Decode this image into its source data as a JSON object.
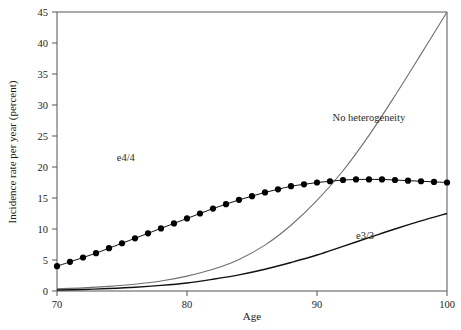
{
  "chart_data": {
    "type": "line",
    "title": "",
    "xlabel": "Age",
    "ylabel": "Incidence rate per year (percent)",
    "xlim": [
      70,
      100
    ],
    "ylim": [
      0,
      45
    ],
    "xticks": [
      70,
      80,
      90,
      100
    ],
    "xtick_labels": [
      "70",
      "80",
      "90",
      "100"
    ],
    "yticks": [
      0,
      5,
      10,
      15,
      20,
      25,
      30,
      35,
      40,
      45
    ],
    "ytick_labels": [
      "0",
      "5",
      "10",
      "15",
      "20",
      "25",
      "30",
      "35",
      "40",
      "45"
    ],
    "grid": false,
    "legend_position": "inline-annotations",
    "annotations": [
      {
        "text": "No heterogeneity",
        "x": 91.2,
        "y": 27.5
      },
      {
        "text": "e4/4",
        "x": 74.6,
        "y": 21.0
      },
      {
        "text": "e3/3",
        "x": 93.0,
        "y": 8.4
      }
    ],
    "series": [
      {
        "name": "No heterogeneity",
        "style": "thin-gray-line",
        "color": "#6f6f6f",
        "markers": false,
        "x": [
          70,
          72,
          74,
          76,
          78,
          80,
          82,
          84,
          86,
          88,
          90,
          92,
          94,
          96,
          98,
          100
        ],
        "values": [
          0.35,
          0.5,
          0.75,
          1.1,
          1.6,
          2.4,
          3.5,
          5.1,
          7.4,
          10.6,
          14.6,
          19.4,
          25.1,
          31.5,
          38.2,
          45.0
        ]
      },
      {
        "name": "e4/4",
        "style": "black-line-with-filled-circles",
        "color": "#000000",
        "markers": true,
        "x": [
          70,
          71,
          72,
          73,
          74,
          75,
          76,
          77,
          78,
          79,
          80,
          81,
          82,
          83,
          84,
          85,
          86,
          87,
          88,
          89,
          90,
          91,
          92,
          93,
          94,
          95,
          96,
          97,
          98,
          99,
          100
        ],
        "values": [
          4.0,
          4.7,
          5.4,
          6.1,
          6.9,
          7.7,
          8.5,
          9.3,
          10.1,
          10.9,
          11.7,
          12.5,
          13.3,
          14.0,
          14.7,
          15.3,
          15.9,
          16.4,
          16.9,
          17.2,
          17.5,
          17.7,
          17.9,
          18.0,
          18.0,
          18.0,
          17.9,
          17.8,
          17.7,
          17.6,
          17.5
        ]
      },
      {
        "name": "e3/3",
        "style": "thick-black-line",
        "color": "#111111",
        "markers": false,
        "x": [
          70,
          72,
          74,
          76,
          78,
          80,
          82,
          84,
          86,
          88,
          90,
          92,
          94,
          96,
          98,
          100
        ],
        "values": [
          0.15,
          0.25,
          0.4,
          0.6,
          0.9,
          1.3,
          1.9,
          2.6,
          3.5,
          4.6,
          5.8,
          7.2,
          8.6,
          10.0,
          11.3,
          12.5
        ]
      }
    ]
  },
  "axes": {
    "x_title": "Age",
    "y_title": "Incidence rate per year (percent)"
  },
  "labels": {
    "no_heterogeneity": "No heterogeneity",
    "e44": "e4/4",
    "e33": "e3/3"
  },
  "colors": {
    "no_heterogeneity_line": "#6f6f6f",
    "e44_line": "#000000",
    "e33_line": "#111111",
    "axis": "#555555",
    "text": "#1b1b1b",
    "background": "#ffffff"
  }
}
